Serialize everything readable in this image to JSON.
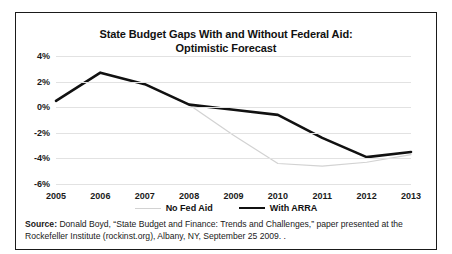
{
  "figure": {
    "title_line1": "State Budget Gaps With and Without Federal Aid:",
    "title_line2": "Optimistic Forecast",
    "border_color": "#1a1a1a",
    "background": "#ffffff"
  },
  "source": {
    "label": "Source:",
    "text": " Donald Boyd, “State Budget and Finance: Trends and Challenges,” paper presented at the Rockefeller Institute (rockinst.org), Albany, NY, September 25 2009. ."
  },
  "legend": {
    "position": "bottom-center",
    "entries": [
      {
        "label": "No Fed Aid",
        "color": "#d2d2d2",
        "width": 1.2
      },
      {
        "label": "With ARRA",
        "color": "#111111",
        "width": 2.6
      }
    ]
  },
  "chart_data": {
    "type": "line",
    "title": "State Budget Gaps With and Without Federal Aid: Optimistic Forecast",
    "xlabel": "",
    "ylabel": "",
    "grid": true,
    "x": [
      2005,
      2006,
      2007,
      2008,
      2009,
      2010,
      2011,
      2012,
      2013
    ],
    "categories": [
      "2005",
      "2006",
      "2007",
      "2008",
      "2009",
      "2010",
      "2011",
      "2012",
      "2013"
    ],
    "ylim": [
      -6,
      4
    ],
    "yticks": [
      4,
      2,
      0,
      -2,
      -4,
      -6
    ],
    "ytick_labels": [
      "4%",
      "2%",
      "0%",
      "-2%",
      "-4%",
      "-6%"
    ],
    "y_unit": "percent",
    "series": [
      {
        "name": "No Fed Aid",
        "color": "#d2d2d2",
        "width": 1.2,
        "values": [
          0.5,
          2.7,
          1.8,
          0.2,
          -2.2,
          -4.4,
          -4.6,
          -4.3,
          -3.7
        ]
      },
      {
        "name": "With ARRA",
        "color": "#111111",
        "width": 2.6,
        "values": [
          0.5,
          2.7,
          1.8,
          0.2,
          -0.2,
          -0.6,
          -2.4,
          -3.9,
          -3.5
        ]
      }
    ]
  }
}
